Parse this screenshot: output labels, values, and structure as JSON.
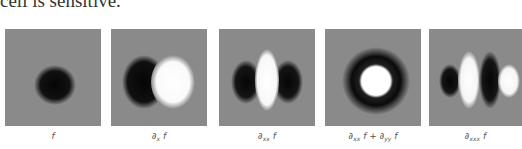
{
  "text_above": "cell is sensitive.",
  "figure": {
    "background_gray": "#8a8a8a",
    "panels": [
      {
        "id": "f",
        "label_main": "∂",
        "label": "f",
        "description": "dark Gaussian blob",
        "x": 5
      },
      {
        "id": "dx",
        "label": "∂ₓ f",
        "sym": "∂",
        "sub": "x",
        "rest": " f",
        "description": "dark left half, bright right half",
        "x": 111
      },
      {
        "id": "dxx",
        "label": "∂ₓₓ f",
        "sym": "∂",
        "sub": "xx",
        "rest": " f",
        "description": "dark-bright-dark vertical bands",
        "x": 219
      },
      {
        "id": "lap",
        "label": "∂ₓₓ f + ∂ᵧᵧ f",
        "sym": "∂",
        "sub": "xx",
        "rest": " f + ",
        "sym2": "∂",
        "sub2": "yy",
        "rest2": " f",
        "description": "bright center disk with dark ring",
        "x": 325
      },
      {
        "id": "dxxx",
        "label": "∂ₓₓₓ f",
        "sym": "∂",
        "sub": "xxx",
        "rest": " f",
        "description": "dark-bright-dark-bright bands",
        "x": 429
      }
    ]
  }
}
